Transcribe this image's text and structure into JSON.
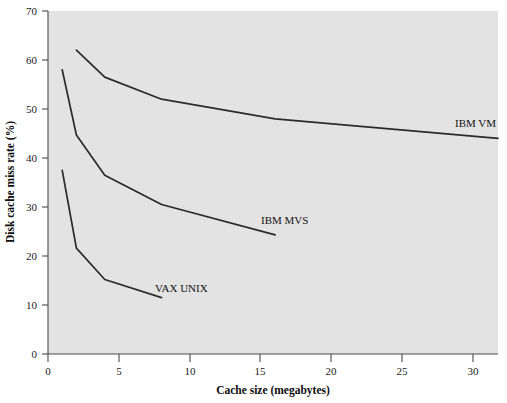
{
  "chart_data": {
    "type": "line",
    "title": "",
    "xlabel": "Cache size (megabytes)",
    "ylabel": "Disk cache miss rate (%)",
    "xlim": [
      0,
      31.7
    ],
    "ylim": [
      0,
      70
    ],
    "xticks": [
      0,
      5,
      10,
      15,
      20,
      25,
      30
    ],
    "xtick_labels": [
      "0",
      "5",
      "10",
      "15",
      "20",
      "25",
      "30"
    ],
    "yticks": [
      0,
      10,
      20,
      30,
      40,
      50,
      60,
      70
    ],
    "ytick_labels": [
      "0",
      "10",
      "20",
      "30",
      "40",
      "50",
      "60",
      "70"
    ],
    "grid": false,
    "legend_position": "inline-annotations",
    "background": "#e3e3e3",
    "line_color": "#2b2b2b",
    "series": [
      {
        "name": "IBM VM",
        "label": "IBM VM",
        "x": [
          2,
          4,
          8,
          16,
          31.7
        ],
        "values": [
          62.0,
          56.5,
          52.0,
          48.0,
          44.0
        ]
      },
      {
        "name": "IBM MVS",
        "label": "IBM MVS",
        "x": [
          1,
          2,
          4,
          8,
          16
        ],
        "values": [
          58.0,
          44.7,
          36.5,
          30.5,
          24.3
        ]
      },
      {
        "name": "VAX UNIX",
        "label": "VAX UNIX",
        "x": [
          1,
          2,
          4,
          8
        ],
        "values": [
          37.5,
          21.6,
          15.2,
          11.5
        ]
      }
    ],
    "annotations": [
      {
        "text": "IBM VM",
        "x_px": 455,
        "y_px": 127
      },
      {
        "text": "IBM MVS",
        "x_px": 261,
        "y_px": 224
      },
      {
        "text": "VAX UNIX",
        "x_px": 155,
        "y_px": 292
      }
    ]
  }
}
